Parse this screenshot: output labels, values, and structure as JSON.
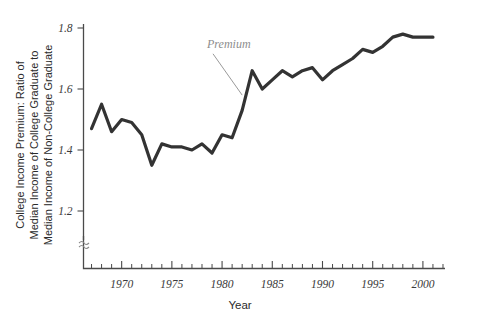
{
  "chart_data": {
    "type": "line",
    "title": "",
    "xlabel": "Year",
    "ylabel": "College Income Premium: Ratio of Median Income of College Graduate to Median Income of Non-College Graduate",
    "ylabel_lines": [
      "College Income Premium: Ratio of",
      "Median Income of College Graduate to",
      "Median Income of Non-College Graduate"
    ],
    "xlim": [
      1966.2,
      2002.2
    ],
    "ylim": [
      1.13,
      1.83
    ],
    "y_axis_break": true,
    "grid": false,
    "legend": "none",
    "x_ticks_major": [
      1970,
      1975,
      1980,
      1985,
      1990,
      1995,
      2000
    ],
    "x_tick_labels": [
      "1970",
      "1975",
      "1980",
      "1985",
      "1990",
      "1995",
      "2000"
    ],
    "x_ticks_minor_start": 1967,
    "x_ticks_minor_end": 2002,
    "y_ticks": [
      1.2,
      1.4,
      1.6,
      1.8
    ],
    "y_tick_labels": [
      "1.2",
      "1.4",
      "1.6",
      "1.8"
    ],
    "series": [
      {
        "name": "Premium",
        "color": "#333333",
        "x": [
          1967,
          1968,
          1969,
          1970,
          1971,
          1972,
          1973,
          1974,
          1975,
          1976,
          1977,
          1978,
          1979,
          1980,
          1981,
          1982,
          1983,
          1984,
          1985,
          1986,
          1987,
          1988,
          1989,
          1990,
          1991,
          1992,
          1993,
          1994,
          1995,
          1996,
          1997,
          1998,
          1999,
          2000,
          2001
        ],
        "values": [
          1.47,
          1.55,
          1.46,
          1.5,
          1.49,
          1.45,
          1.35,
          1.42,
          1.41,
          1.41,
          1.4,
          1.42,
          1.39,
          1.45,
          1.44,
          1.53,
          1.66,
          1.6,
          1.63,
          1.66,
          1.64,
          1.66,
          1.67,
          1.63,
          1.66,
          1.68,
          1.7,
          1.73,
          1.72,
          1.74,
          1.77,
          1.78,
          1.77,
          1.77,
          1.77
        ]
      }
    ],
    "annotations": [
      {
        "text": "Premium",
        "x": 1978.5,
        "y": 1.735,
        "leader_to_x": 1982.0,
        "leader_to_y": 1.58
      }
    ]
  }
}
